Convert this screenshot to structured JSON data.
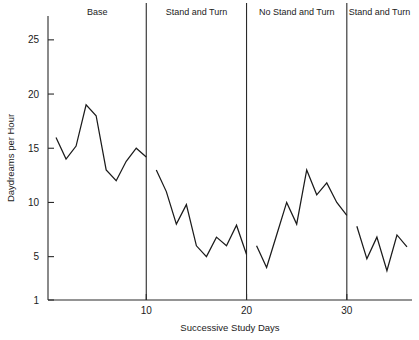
{
  "chart_data": {
    "type": "line",
    "title": "",
    "xlabel": "Successive Study Days",
    "ylabel": "Daydreams per Hour",
    "xlim": [
      0.2,
      36.5
    ],
    "ylim": [
      1,
      27.2
    ],
    "grid": false,
    "legend": false,
    "x_ticks": [
      10,
      20,
      30
    ],
    "x_tick_labels": [
      "10",
      "20",
      "30"
    ],
    "y_ticks": [
      1,
      5,
      10,
      15,
      20,
      25
    ],
    "y_tick_labels": [
      "1",
      "5",
      "10",
      "15",
      "20",
      "25"
    ],
    "phases": [
      {
        "label": "Base",
        "x_start": 1,
        "x_end": 10,
        "divider_x": 10
      },
      {
        "label": "Stand and Turn",
        "x_start": 11,
        "x_end": 20,
        "divider_x": 20
      },
      {
        "label": "No Stand and Turn",
        "x_start": 21,
        "x_end": 30,
        "divider_x": 30
      },
      {
        "label": "Stand and Turn",
        "x_start": 31,
        "x_end": 36,
        "divider_x": null
      }
    ],
    "series": [
      {
        "name": "Daydreams per Hour",
        "segments": [
          {
            "phase": "Base",
            "x": [
              1,
              2,
              3,
              4,
              5,
              6,
              7,
              8,
              9,
              10
            ],
            "values": [
              16,
              14,
              15.2,
              19,
              18,
              13,
              12,
              13.8,
              15,
              14.2
            ]
          },
          {
            "phase": "Stand and Turn",
            "x": [
              11,
              12,
              13,
              14,
              15,
              16,
              17,
              18,
              19,
              20
            ],
            "values": [
              13,
              11,
              8,
              9.8,
              6,
              5,
              6.8,
              6,
              7.9,
              5.2
            ]
          },
          {
            "phase": "No Stand and Turn",
            "x": [
              21,
              22,
              23,
              24,
              25,
              26,
              27,
              28,
              29,
              30
            ],
            "values": [
              6,
              4,
              7,
              10,
              8,
              13,
              10.7,
              11.8,
              10,
              8.8
            ]
          },
          {
            "phase": "Stand and Turn",
            "x": [
              31,
              32,
              33,
              34,
              35,
              36
            ],
            "values": [
              7.8,
              4.8,
              6.8,
              3.7,
              7,
              5.9
            ]
          }
        ]
      }
    ],
    "colors": {
      "line": "#1b1b1b",
      "axis": "#2a2a2a",
      "text": "#1b1b1b",
      "background": "#ffffff"
    }
  }
}
